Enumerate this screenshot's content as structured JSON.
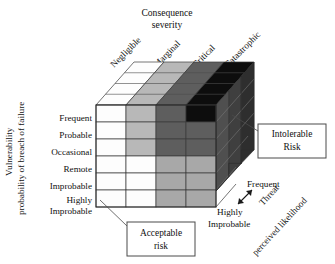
{
  "diagram": {
    "title_lines": [
      "Consequence",
      "severity"
    ],
    "type": "risk-assessment-cube",
    "axes": {
      "x": {
        "name_lines": [
          "Consequence",
          "severity"
        ],
        "categories": [
          "Negligible",
          "Marginal",
          "Critical",
          "Catastrophic"
        ]
      },
      "y": {
        "name_lines": [
          "Vulnerability",
          "probability of breach of failure"
        ],
        "categories": [
          "Frequent",
          "Probable",
          "Occasional",
          "Remote",
          "Improbable",
          "Highly Improbable"
        ],
        "category_parts": [
          [
            "Frequent"
          ],
          [
            "Probable"
          ],
          [
            "Occasional"
          ],
          [
            "Remote"
          ],
          [
            "Improbable"
          ],
          [
            "Highly",
            "Improbable"
          ]
        ]
      },
      "z": {
        "name_lines": [
          "Threat",
          "perceived likelihood"
        ],
        "high_label": "Frequent",
        "low_label_parts": [
          "Highly",
          "Improbable"
        ]
      }
    },
    "callouts": [
      {
        "id": "intolerable",
        "lines": [
          "Intolerable",
          "Risk"
        ]
      },
      {
        "id": "acceptable",
        "lines": [
          "Acceptable",
          "risk"
        ]
      }
    ],
    "legend_shades": {
      "white": "#ffffff",
      "light_gray": "#b8b8b8",
      "mid_gray": "#a8a8a8",
      "dark_gray": "#5e5e5e",
      "black": "#0d0d0d",
      "outline": "#3a3a3a"
    },
    "front_face_matrix": [
      [
        "white",
        "light_gray",
        "dark_gray",
        "black"
      ],
      [
        "white",
        "light_gray",
        "dark_gray",
        "dark_gray"
      ],
      [
        "white",
        "light_gray",
        "dark_gray",
        "dark_gray"
      ],
      [
        "white",
        "white",
        "mid_gray",
        "mid_gray"
      ],
      [
        "white",
        "white",
        "mid_gray",
        "mid_gray"
      ],
      [
        "white",
        "white",
        "mid_gray",
        "mid_gray"
      ]
    ],
    "top_face_columns": [
      "white",
      "light_gray",
      "dark_gray",
      "black"
    ],
    "top_face_depth_rows": 4,
    "side_face_depth_cols": 3,
    "side_face_shade": "dark_gray"
  }
}
